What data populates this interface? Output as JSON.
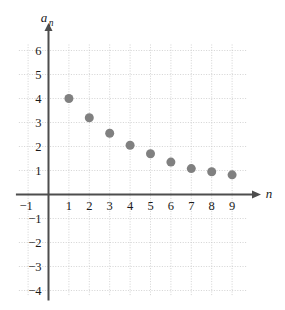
{
  "chart_data": {
    "type": "scatter",
    "title": "",
    "subtitle": "",
    "xlabel": "n",
    "ylabel": "a_n",
    "ylabel_base": "a",
    "ylabel_sub": "n",
    "x": [
      1,
      2,
      3,
      4,
      5,
      6,
      7,
      8,
      9
    ],
    "values": [
      4.0,
      3.2,
      2.55,
      2.05,
      1.7,
      1.35,
      1.08,
      0.95,
      0.82
    ],
    "series": [
      {
        "name": "a_n",
        "values": [
          4.0,
          3.2,
          2.55,
          2.05,
          1.7,
          1.35,
          1.08,
          0.95,
          0.82
        ]
      }
    ],
    "xlim": [
      -1.6,
      10.2
    ],
    "ylim": [
      -4.4,
      6.6
    ],
    "xticks": [
      -1,
      1,
      2,
      3,
      4,
      5,
      6,
      7,
      8,
      9
    ],
    "xtick_labels": [
      "−1",
      "1",
      "2",
      "3",
      "4",
      "5",
      "6",
      "7",
      "8",
      "9"
    ],
    "yticks": [
      6,
      5,
      4,
      3,
      2,
      1,
      -1,
      -2,
      -3,
      -4
    ],
    "ytick_labels": [
      "6",
      "5",
      "4",
      "3",
      "2",
      "1",
      "−1",
      "−2",
      "−3",
      "−4"
    ],
    "grid": true,
    "grid_style": "dotted",
    "legend": false,
    "legend_position": "none",
    "marker": "circle",
    "marker_size": 9,
    "colors": {
      "marker": "#808080",
      "axis": "#4d4d4d",
      "grid": "#c8c8c8",
      "text": "#1a1a1a",
      "background": "#ffffff"
    }
  }
}
